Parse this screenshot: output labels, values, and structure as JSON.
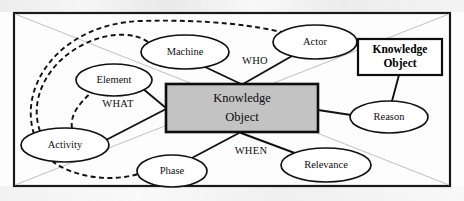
{
  "diagram": {
    "frame": {
      "stroke_color": "#1a1a1a",
      "diagonal_color": "#b9b9b9"
    },
    "center_box": {
      "line1": "Knowledge",
      "line2": "Object",
      "fill_color": "#c3c3c3",
      "stroke_color": "#0d0d0d"
    },
    "knowledge_object_box": {
      "line1": "Knowledge",
      "line2": "Object",
      "fill_color": "#ffffff",
      "stroke_color": "#0d0d0d"
    },
    "nodes": [
      {
        "id": "machine",
        "label": "Machine",
        "cx": 185,
        "cy": 52,
        "rx": 44,
        "ry": 17
      },
      {
        "id": "actor",
        "label": "Actor",
        "cx": 315,
        "cy": 42,
        "rx": 42,
        "ry": 17
      },
      {
        "id": "element",
        "label": "Element",
        "cx": 114,
        "cy": 80,
        "rx": 38,
        "ry": 16
      },
      {
        "id": "activity",
        "label": "Activity",
        "cx": 65,
        "cy": 145,
        "rx": 44,
        "ry": 17
      },
      {
        "id": "phase",
        "label": "Phase",
        "cx": 172,
        "cy": 171,
        "rx": 35,
        "ry": 16
      },
      {
        "id": "relevance",
        "label": "Relevance",
        "cx": 326,
        "cy": 165,
        "rx": 45,
        "ry": 17
      },
      {
        "id": "reason",
        "label": "Reason",
        "cx": 389,
        "cy": 117,
        "rx": 39,
        "ry": 16
      }
    ],
    "question_labels": [
      {
        "id": "who",
        "label": "WHO",
        "x": 255,
        "y": 62
      },
      {
        "id": "what",
        "label": "WHAT",
        "x": 118,
        "y": 105
      },
      {
        "id": "when",
        "label": "WHEN",
        "x": 251,
        "y": 152
      }
    ],
    "connections": [
      {
        "id": "machine-to-center",
        "from": "machine",
        "to": "center-box",
        "style": "solid"
      },
      {
        "id": "actor-to-center",
        "from": "actor",
        "to": "center-box",
        "style": "solid"
      },
      {
        "id": "element-to-center",
        "from": "element",
        "to": "center-box",
        "style": "solid"
      },
      {
        "id": "activity-to-center",
        "from": "activity",
        "to": "center-box",
        "style": "solid"
      },
      {
        "id": "phase-to-center",
        "from": "phase",
        "to": "center-box",
        "style": "solid"
      },
      {
        "id": "relevance-to-center",
        "from": "relevance",
        "to": "center-box",
        "style": "solid"
      },
      {
        "id": "reason-to-center",
        "from": "reason",
        "to": "center-box",
        "style": "solid"
      },
      {
        "id": "reason-to-ko-box",
        "from": "reason",
        "to": "knowledge-object-box",
        "style": "solid"
      },
      {
        "id": "activity-to-element",
        "from": "activity",
        "to": "element",
        "style": "dashed"
      },
      {
        "id": "activity-to-machine",
        "from": "activity",
        "to": "machine",
        "style": "dashed"
      },
      {
        "id": "activity-to-actor",
        "from": "activity",
        "to": "actor",
        "style": "dashed"
      },
      {
        "id": "activity-to-phase",
        "from": "activity",
        "to": "phase",
        "style": "dashed"
      }
    ]
  }
}
